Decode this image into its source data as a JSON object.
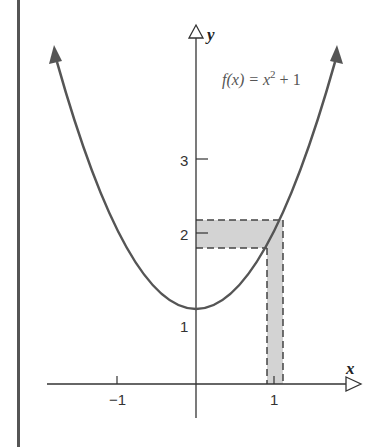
{
  "figure": {
    "function_label": {
      "prefix": "f(x) = x",
      "exponent": "2",
      "suffix": " + 1"
    },
    "axes": {
      "x_label": "x",
      "y_label": "y",
      "x_ticks": [
        {
          "value": -1,
          "label": "−1"
        },
        {
          "value": 1,
          "label": "1"
        }
      ],
      "y_ticks": [
        {
          "value": 1,
          "label": "1"
        },
        {
          "value": 2,
          "label": "2"
        },
        {
          "value": 3,
          "label": "3"
        }
      ]
    },
    "shaded_region": {
      "x_interval": [
        0.91,
        1.11
      ],
      "y_interval": [
        1.83,
        2.22
      ],
      "fill": "#d3d3d3"
    },
    "colors": {
      "curve": "#555555",
      "axes": "#333333",
      "border": "#555555"
    }
  }
}
